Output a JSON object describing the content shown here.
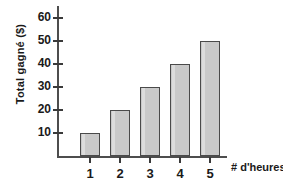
{
  "chart_data": {
    "type": "bar",
    "title": "",
    "xlabel": "# d'heures",
    "ylabel": "Total gagné ($)",
    "categories": [
      "1",
      "2",
      "3",
      "4",
      "5"
    ],
    "values": [
      10,
      20,
      30,
      40,
      50
    ],
    "ylim": [
      0,
      65
    ],
    "yticks": [
      10,
      20,
      30,
      40,
      50,
      60
    ],
    "ytick_labels": [
      "10",
      "20",
      "30",
      "40",
      "50",
      "60"
    ],
    "grid": false,
    "legend": null,
    "bar_color": "#c9c9c9",
    "bar_edge_color": "#4a4a4a",
    "axis_color": "#4d4d4d",
    "background": "#ffffff"
  }
}
